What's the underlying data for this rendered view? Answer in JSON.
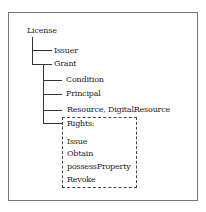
{
  "tree": {
    "root": "License",
    "level1": [
      "Issuer",
      "Grant"
    ],
    "grant_children": [
      "Condition",
      "Principal",
      "Resource, DigitalResource",
      "Rights:"
    ],
    "rights": [
      "Issue",
      "Obtain",
      "possessProperty",
      "Revoke"
    ]
  }
}
